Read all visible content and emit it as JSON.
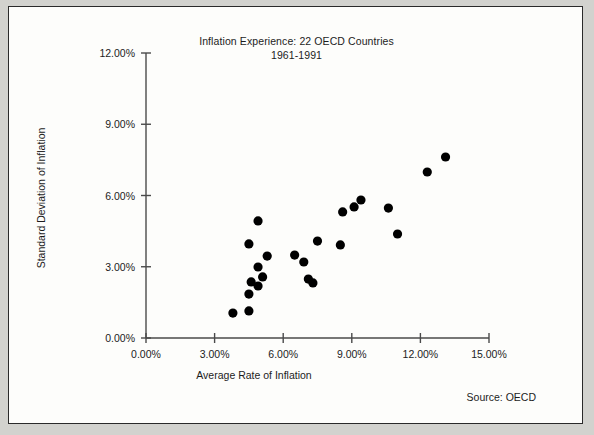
{
  "chart_data": {
    "type": "scatter",
    "title": "Inflation Experience: 22 OECD Countries",
    "subtitle": "1961-1991",
    "xlabel": "Average Rate of Inflation",
    "ylabel": "Standard Deviation of Inflation",
    "source": "Source: OECD",
    "xlim": [
      0,
      15
    ],
    "ylim": [
      0,
      12
    ],
    "xticks": [
      "0.00%",
      "3.00%",
      "6.00%",
      "9.00%",
      "12.00%",
      "15.00%"
    ],
    "xtick_values": [
      0,
      3,
      6,
      9,
      12,
      15
    ],
    "yticks": [
      "0.00%",
      "3.00%",
      "6.00%",
      "9.00%",
      "12.00%"
    ],
    "ytick_values": [
      0,
      3,
      6,
      9,
      12
    ],
    "grid": false,
    "legend": null,
    "marker_color": "#000000",
    "axis_color": "#4a4a4a",
    "point_count": 22,
    "points": [
      {
        "x": 3.8,
        "y": 1.05
      },
      {
        "x": 4.5,
        "y": 1.14
      },
      {
        "x": 4.5,
        "y": 1.85
      },
      {
        "x": 4.6,
        "y": 2.36
      },
      {
        "x": 4.9,
        "y": 2.19
      },
      {
        "x": 4.9,
        "y": 2.99
      },
      {
        "x": 4.5,
        "y": 3.96
      },
      {
        "x": 4.9,
        "y": 4.93
      },
      {
        "x": 5.1,
        "y": 2.57
      },
      {
        "x": 5.3,
        "y": 3.45
      },
      {
        "x": 6.5,
        "y": 3.49
      },
      {
        "x": 6.9,
        "y": 3.2
      },
      {
        "x": 7.1,
        "y": 2.48
      },
      {
        "x": 7.3,
        "y": 2.32
      },
      {
        "x": 7.5,
        "y": 4.08
      },
      {
        "x": 8.5,
        "y": 3.92
      },
      {
        "x": 8.6,
        "y": 5.31
      },
      {
        "x": 9.1,
        "y": 5.52
      },
      {
        "x": 9.4,
        "y": 5.81
      },
      {
        "x": 10.6,
        "y": 5.47
      },
      {
        "x": 11.0,
        "y": 4.38
      },
      {
        "x": 12.3,
        "y": 6.99
      },
      {
        "x": 13.1,
        "y": 7.62
      }
    ]
  }
}
